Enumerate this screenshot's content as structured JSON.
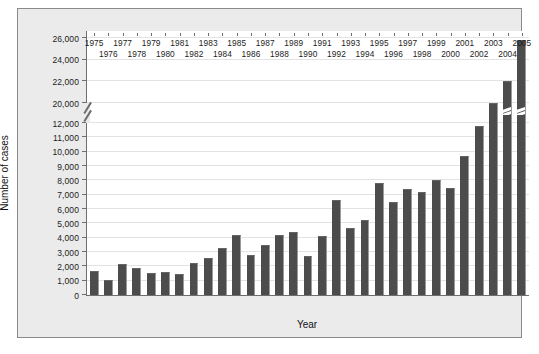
{
  "chart_data": {
    "type": "bar",
    "title": "",
    "xlabel": "Year",
    "ylabel": "Number of cases",
    "grid": true,
    "legend": null,
    "ylim": [
      0,
      26000
    ],
    "y_axis_break": {
      "present": true,
      "break_between": [
        12000,
        20000
      ],
      "note": "axis break drawn as double slash between 12,000 and 20,000"
    },
    "ytick_labels": [
      "0",
      "1,000",
      "2,000",
      "3,000",
      "4,000",
      "5,000",
      "6,000",
      "7,000",
      "8,000",
      "9,000",
      "10,000",
      "11,000",
      "12,000",
      "20,000",
      "22,000",
      "24,000",
      "26,000"
    ],
    "ytick_values": [
      0,
      1000,
      2000,
      3000,
      4000,
      5000,
      6000,
      7000,
      8000,
      9000,
      10000,
      11000,
      12000,
      20000,
      22000,
      24000,
      26000
    ],
    "categories": [
      "1975",
      "1976",
      "1977",
      "1978",
      "1979",
      "1980",
      "1981",
      "1982",
      "1983",
      "1984",
      "1985",
      "1986",
      "1987",
      "1988",
      "1989",
      "1990",
      "1991",
      "1992",
      "1993",
      "1994",
      "1995",
      "1996",
      "1997",
      "1998",
      "1999",
      "2000",
      "2001",
      "2002",
      "2003",
      "2004",
      "2005"
    ],
    "values": [
      1700,
      1050,
      2150,
      1900,
      1550,
      1600,
      1450,
      2200,
      2600,
      3300,
      4200,
      2800,
      3500,
      4200,
      4400,
      2750,
      4100,
      6600,
      4700,
      5200,
      7800,
      6500,
      7400,
      7200,
      8000,
      7500,
      9700,
      11800,
      15000,
      22000,
      25800
    ],
    "bars_with_break_mark": [
      "2004",
      "2005"
    ],
    "xtick_label_rows": {
      "top_row": [
        "1975",
        "1977",
        "1979",
        "1981",
        "1983",
        "1985",
        "1987",
        "1989",
        "1991",
        "1993",
        "1995",
        "1997",
        "1999",
        "2001",
        "2003",
        "2005"
      ],
      "bottom_row": [
        "1976",
        "1978",
        "1980",
        "1982",
        "1984",
        "1986",
        "1988",
        "1990",
        "1992",
        "1994",
        "1996",
        "1998",
        "2000",
        "2002",
        "2004"
      ]
    },
    "colors": {
      "bar": "#4c4c4c",
      "bar_edge": "#9a9a9a",
      "grid": "#e2e2e2",
      "axis": "#6e6e6e",
      "panel_background": "#ebebeb",
      "plot_background": "#ffffff",
      "text": "#1c1c1c"
    }
  },
  "caption": ""
}
